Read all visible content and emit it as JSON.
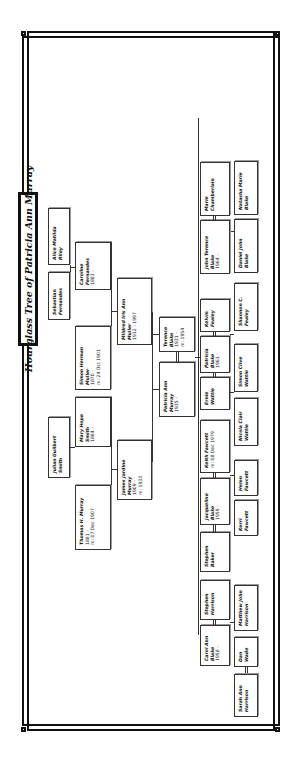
{
  "title": "Hourglass Tree of Patricia Ann Murray",
  "ancestors": {
    "alice": {
      "name": "Alice Matilda Riley",
      "lines": []
    },
    "sebastian": {
      "name": "Sebastian Fernandes",
      "lines": []
    },
    "caroline": {
      "name": "Caroline Fernandes",
      "lines": [
        "1883 -"
      ]
    },
    "simon": {
      "name": "Simon Herman Muller",
      "lines": [
        "1870 -",
        "m: 24 Oct 1901"
      ]
    },
    "mildred": {
      "name": "Mildred Iris Ann Muller",
      "lines": [
        "1912 - 1997"
      ]
    },
    "julian": {
      "name": "Julian Guilbert Smith",
      "lines": []
    },
    "mary": {
      "name": "Mary Hope Smith",
      "lines": [
        "1884 -"
      ]
    },
    "thomas": {
      "name": "Thomas H. Murray",
      "lines": [
        "1881 -",
        "m: 07 Dec 1907"
      ]
    },
    "james": {
      "name": "James Jardine Murray",
      "lines": [
        "1909 -",
        "m: 1933"
      ]
    }
  },
  "focus": {
    "terence": {
      "name": "Terence Blake",
      "lines": [
        "1931 -",
        "m: 1954"
      ]
    },
    "patricia": {
      "name": "Patricia Ann Murray",
      "lines": [
        "1935 -"
      ]
    }
  },
  "children": {
    "marie": {
      "name": "Marie Chamberlain",
      "lines": []
    },
    "john": {
      "name": "John Terence Blake",
      "lines": [
        "1964 -"
      ]
    },
    "kelvin": {
      "name": "Kelvin Fealey",
      "lines": []
    },
    "patricia_b": {
      "name": "Patricia Blake",
      "lines": [
        "1961 -"
      ]
    },
    "ernie": {
      "name": "Ernie Wattie",
      "lines": []
    },
    "keith": {
      "name": "Keith Fawcett",
      "lines": [
        "m: 08 Dec 1979"
      ]
    },
    "jacqueline": {
      "name": "Jacqueline Blake",
      "lines": [
        "1959 -"
      ]
    },
    "stephen_b": {
      "name": "Stephen Baker",
      "lines": []
    },
    "stephen_h": {
      "name": "Stephen Harrison",
      "lines": []
    },
    "carol": {
      "name": "Carol Ann Blake",
      "lines": [
        "1958 -"
      ]
    }
  },
  "grandchildren": {
    "natasha": {
      "name": "Natasha Marie Blake",
      "lines": []
    },
    "daniel": {
      "name": "Daniel John Blake",
      "lines": []
    },
    "shannon": {
      "name": "Shannon C. Fealey",
      "lines": []
    },
    "simon_w": {
      "name": "Simon Clive Wattie",
      "lines": []
    },
    "nicola": {
      "name": "Nicola Clair Wattie",
      "lines": []
    },
    "helen": {
      "name": "Helen Fawcett",
      "lines": []
    },
    "kerri": {
      "name": "Kerri Fawcett",
      "lines": []
    },
    "matthew": {
      "name": "Matthew John Harrison",
      "lines": []
    },
    "dan": {
      "name": "Dan Wade",
      "lines": []
    },
    "sarah": {
      "name": "Sarah Ann Harrison",
      "lines": []
    }
  }
}
